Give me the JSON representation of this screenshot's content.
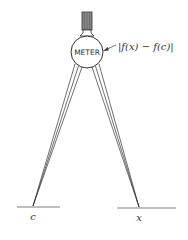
{
  "figure": {
    "meter_label": "METER",
    "readout_label": "|f(x) − f(c)|",
    "left_point_label": "c",
    "right_point_label": "x",
    "colors": {
      "ink": "#333333",
      "knob": "#777777",
      "background": "#ffffff"
    }
  }
}
